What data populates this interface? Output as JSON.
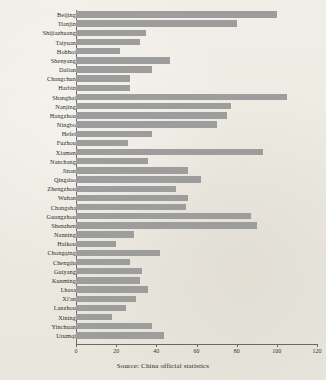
{
  "source_note": "Source: China official statistics",
  "colors": {
    "bar": "#9d9d9d",
    "background": "#efece4",
    "axis": "#6b6860",
    "text": "#2c2a26"
  },
  "chart_data": {
    "type": "bar",
    "orientation": "horizontal",
    "title": "",
    "subtitle": "",
    "xlabel": "",
    "ylabel": "",
    "xlim": [
      0,
      120
    ],
    "xticks": [
      0,
      20,
      40,
      60,
      80,
      100,
      120
    ],
    "xtick_labels": [
      "0",
      "20",
      "40",
      "60",
      "80",
      "100",
      "120"
    ],
    "grid": false,
    "legend": false,
    "annotation": "Source: China official statistics",
    "categories": [
      "Beijing",
      "Tianjin",
      "Shijiazhuang",
      "Taiyuan",
      "Hohhot",
      "Shenyang",
      "Dalian",
      "Changchun",
      "Harbin",
      "Shanghai",
      "Nanjing",
      "Hangzhou",
      "Ningbo",
      "Hefei",
      "Fuzhou",
      "Xiamen",
      "Nanchang",
      "Jinan",
      "Qingdao",
      "Zhengzhou",
      "Wuhan",
      "Changsha",
      "Guangzhou",
      "Shenzhen",
      "Nanning",
      "Haikou",
      "Chongqing",
      "Chengdu",
      "Guiyang",
      "Kunming",
      "Lhasa",
      "Xi'an",
      "Lanzhou",
      "Xining",
      "Yinchuan",
      "Urumqi"
    ],
    "values": [
      100,
      80,
      35,
      32,
      22,
      47,
      38,
      27,
      27,
      105,
      77,
      75,
      70,
      38,
      26,
      93,
      36,
      56,
      62,
      50,
      56,
      55,
      87,
      90,
      29,
      20,
      42,
      27,
      33,
      32,
      36,
      30,
      25,
      18,
      38,
      44
    ]
  }
}
